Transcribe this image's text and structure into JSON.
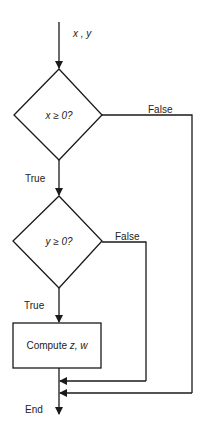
{
  "diagram": {
    "type": "flowchart",
    "input_label": "x , y",
    "decision1": {
      "text": "x ≥ 0?",
      "true_label": "True",
      "false_label": "False"
    },
    "decision2": {
      "text": "y ≥ 0?",
      "true_label": "True",
      "false_label": "False"
    },
    "process": {
      "text_prefix": "Compute ",
      "text_vars": "z, w"
    },
    "end_label": "End",
    "colors": {
      "stroke": "#1a1a1a",
      "background": "#ffffff",
      "text": "#222222"
    }
  }
}
